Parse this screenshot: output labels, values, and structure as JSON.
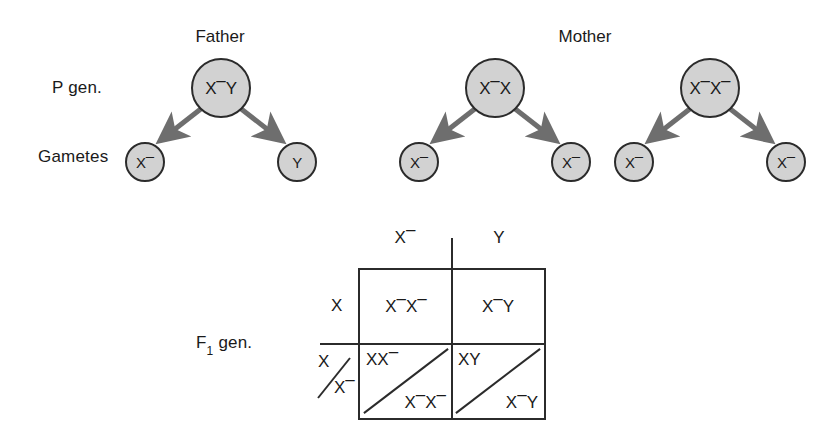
{
  "figure": {
    "type": "genetics-pedigree-punnett",
    "background": "#ffffff",
    "circle_fill": "#d2d2d2",
    "stroke": "#2b2b2b",
    "arrow_color": "#6e6e6e"
  },
  "side_labels": {
    "p_gen": "P gen.",
    "gametes": "Gametes",
    "f1_gen_prefix": "F",
    "f1_gen_sub": "1",
    "f1_gen_suffix": " gen."
  },
  "parents": {
    "father": {
      "title": "Father",
      "genotype_main": "X",
      "genotype_sup": "–",
      "genotype_tail": "Y",
      "gametes": [
        {
          "main": "X",
          "sup": "–",
          "tail": ""
        },
        {
          "main": "Y",
          "sup": "",
          "tail": ""
        }
      ]
    },
    "mother": {
      "title": "Mother",
      "individuals": [
        {
          "genotype_main": "X",
          "genotype_sup": "–",
          "genotype_tail": "X",
          "gametes": [
            {
              "main": "X",
              "sup": "–",
              "tail": ""
            },
            {
              "main": "X",
              "sup": "–",
              "tail": ""
            }
          ]
        },
        {
          "genotype_main": "X",
          "genotype_sup": "–",
          "genotype_tail": "X",
          "genotype_tail_sup": "–",
          "gametes": [
            {
              "main": "X",
              "sup": "–",
              "tail": ""
            },
            {
              "main": "X",
              "sup": "–",
              "tail": ""
            }
          ]
        }
      ]
    }
  },
  "punnett": {
    "col_headers": [
      {
        "main": "X",
        "sup": "–"
      },
      {
        "main": "Y",
        "sup": ""
      }
    ],
    "row_headers": [
      {
        "main": "X",
        "sup": "",
        "split": false
      },
      {
        "top_main": "X",
        "top_sup": "",
        "bottom_main": "X",
        "bottom_sup": "–",
        "split": true
      }
    ],
    "cells": [
      [
        {
          "split": false,
          "single": "X–X–",
          "single_parts": [
            [
              "X",
              "–"
            ],
            [
              "X",
              "–"
            ]
          ]
        },
        {
          "split": false,
          "single": "X–Y",
          "single_parts": [
            [
              "X",
              "–"
            ],
            [
              "Y",
              ""
            ]
          ]
        }
      ],
      [
        {
          "split": true,
          "upper_parts": [
            [
              "X",
              ""
            ],
            [
              "X",
              "–"
            ]
          ],
          "lower_parts": [
            [
              "X",
              "–"
            ],
            [
              "X",
              "–"
            ]
          ]
        },
        {
          "split": true,
          "upper_parts": [
            [
              "X",
              ""
            ],
            [
              "Y",
              ""
            ]
          ],
          "lower_parts": [
            [
              "X",
              "–"
            ],
            [
              "Y",
              ""
            ]
          ]
        }
      ]
    ]
  }
}
